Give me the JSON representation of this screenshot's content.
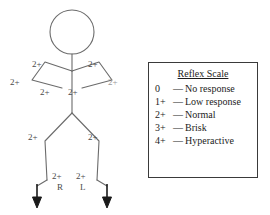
{
  "diagram": {
    "stroke_color": "#6b6b6b",
    "text_color": "#4a4a4a",
    "arrow_color": "#1a1a1a",
    "figure": {
      "head": {
        "cx": 72,
        "cy": 32,
        "r": 22
      },
      "neck": {
        "x1": 72,
        "y1": 54,
        "x2": 72,
        "y2": 71
      },
      "torso": {
        "x1": 72,
        "y1": 71,
        "x2": 72,
        "y2": 113
      },
      "left_arm_path": "M72,71 L45,62 L32,80 L62,88",
      "right_arm_path": "M72,71 L99,62 L112,80 L82,88",
      "left_leg_path": "M72,113 L45,141 L47,180",
      "right_leg_path": "M72,113 L99,141 L97,180",
      "left_foot_path": "M47,180 L37,186",
      "right_foot_path": "M97,180 L107,186"
    },
    "arrows": [
      {
        "name": "left-arrow",
        "x": 37,
        "y_top": 184,
        "y_bottom": 208
      },
      {
        "name": "right-arrow",
        "x": 107,
        "y_top": 184,
        "y_bottom": 208
      }
    ],
    "reflex_labels": [
      {
        "name": "left-biceps",
        "value": "2+",
        "x": 32,
        "y": 60,
        "faint": false
      },
      {
        "name": "left-brachioradialis",
        "value": "2+",
        "x": 10,
        "y": 78,
        "faint": false
      },
      {
        "name": "left-triceps",
        "value": "2+",
        "x": 40,
        "y": 88,
        "faint": false
      },
      {
        "name": "right-biceps",
        "value": "2+",
        "x": 88,
        "y": 60,
        "faint": false
      },
      {
        "name": "right-brachioradialis",
        "value": "2+",
        "x": 108,
        "y": 78,
        "faint": true
      },
      {
        "name": "right-triceps",
        "value": "2+",
        "x": 68,
        "y": 88,
        "faint": false
      },
      {
        "name": "left-patellar",
        "value": "2+",
        "x": 28,
        "y": 133,
        "faint": false
      },
      {
        "name": "right-patellar",
        "value": "2+",
        "x": 88,
        "y": 133,
        "faint": false
      },
      {
        "name": "left-achilles",
        "value": "2+",
        "x": 52,
        "y": 172,
        "faint": false
      },
      {
        "name": "right-achilles",
        "value": "2+",
        "x": 76,
        "y": 172,
        "faint": false
      }
    ],
    "side_labels": [
      {
        "name": "right-side-marker",
        "value": "R",
        "x": 57,
        "y": 183
      },
      {
        "name": "left-side-marker",
        "value": "L",
        "x": 80,
        "y": 183
      }
    ]
  },
  "legend": {
    "title": "Reflex Scale",
    "rows": [
      {
        "score": "0",
        "dash": "—",
        "description": "No response"
      },
      {
        "score": "1+",
        "dash": "—",
        "description": "Low response"
      },
      {
        "score": "2+",
        "dash": "—",
        "description": "Normal"
      },
      {
        "score": "3+",
        "dash": "—",
        "description": "Brisk"
      },
      {
        "score": "4+",
        "dash": "—",
        "description": "Hyperactive"
      }
    ]
  }
}
